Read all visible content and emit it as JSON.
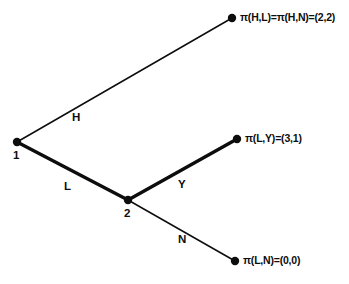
{
  "diagram": {
    "type": "game-tree",
    "background_color": "#ffffff",
    "ink_color": "#0d0d0d"
  },
  "decision_nodes": [
    {
      "id": "node-1",
      "label": "1",
      "x": 17,
      "y": 142,
      "label_x": 13,
      "label_y": 150
    },
    {
      "id": "node-2",
      "label": "2",
      "x": 128,
      "y": 200,
      "label_x": 124,
      "label_y": 208
    }
  ],
  "terminal_nodes": [
    {
      "id": "terminal-top",
      "x": 232,
      "y": 18
    },
    {
      "id": "terminal-middle",
      "x": 237,
      "y": 139
    },
    {
      "id": "terminal-bottom",
      "x": 235,
      "y": 261
    }
  ],
  "branches": [
    {
      "id": "branch-h",
      "label": "H",
      "from": "node-1",
      "to": "terminal-top",
      "x1": 17,
      "y1": 142,
      "x2": 232,
      "y2": 18,
      "bold": false,
      "stroke_width": 1.5,
      "label_x": 72,
      "label_y": 112
    },
    {
      "id": "branch-l",
      "label": "L",
      "from": "node-1",
      "to": "node-2",
      "x1": 17,
      "y1": 142,
      "x2": 128,
      "y2": 200,
      "bold": true,
      "stroke_width": 3.4,
      "label_x": 64,
      "label_y": 181
    },
    {
      "id": "branch-y",
      "label": "Y",
      "from": "node-2",
      "to": "terminal-middle",
      "x1": 128,
      "y1": 200,
      "x2": 237,
      "y2": 139,
      "bold": true,
      "stroke_width": 3.4,
      "label_x": 178,
      "label_y": 179
    },
    {
      "id": "branch-n",
      "label": "N",
      "from": "node-2",
      "to": "terminal-bottom",
      "x1": 128,
      "y1": 200,
      "x2": 235,
      "y2": 261,
      "bold": false,
      "stroke_width": 1.5,
      "label_x": 178,
      "label_y": 234
    }
  ],
  "payoff_labels": [
    {
      "id": "payoff-top",
      "text": "π(H,L)=π(H,N)=(2,2)",
      "x": 240,
      "y": 12
    },
    {
      "id": "payoff-middle",
      "text": "π(L,Y)=(3,1)",
      "x": 245,
      "y": 133
    },
    {
      "id": "payoff-bottom",
      "text": "π(L,N)=(0,0)",
      "x": 243,
      "y": 255
    }
  ],
  "chart_data": {
    "type": "tree",
    "nodes": [
      {
        "name": "1",
        "player": 1,
        "kind": "decision"
      },
      {
        "name": "2",
        "player": 2,
        "kind": "decision"
      }
    ],
    "edges": [
      {
        "from": "1",
        "to": "terminal-top",
        "action": "H",
        "on_equilibrium_path": false
      },
      {
        "from": "1",
        "to": "2",
        "action": "L",
        "on_equilibrium_path": true
      },
      {
        "from": "2",
        "to": "terminal-middle",
        "action": "Y",
        "on_equilibrium_path": true
      },
      {
        "from": "2",
        "to": "terminal-bottom",
        "action": "N",
        "on_equilibrium_path": false
      }
    ],
    "payoffs": [
      {
        "profile": "(H,L)",
        "value": [
          2,
          2
        ]
      },
      {
        "profile": "(H,N)",
        "value": [
          2,
          2
        ]
      },
      {
        "profile": "(L,Y)",
        "value": [
          3,
          1
        ]
      },
      {
        "profile": "(L,N)",
        "value": [
          0,
          0
        ]
      }
    ]
  }
}
